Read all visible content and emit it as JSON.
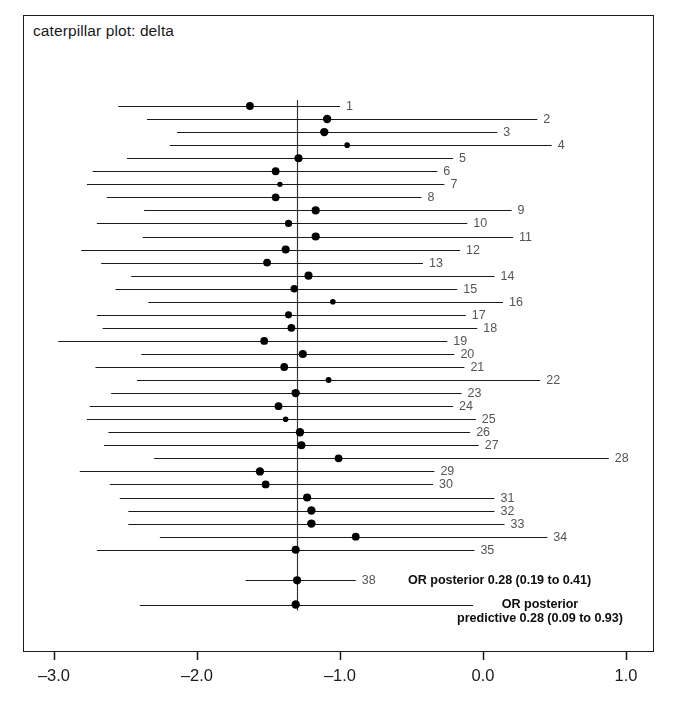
{
  "chart_data": {
    "type": "scatter",
    "title": "caterpillar plot: delta",
    "xlabel": "",
    "ylabel": "",
    "xlim": [
      -3.45,
      1.2
    ],
    "xticks": [
      -3.0,
      -2.0,
      -1.0,
      0.0,
      1.0
    ],
    "xticklabels": [
      "-3.0",
      "-2.0",
      "-1.0",
      "0.0",
      "1.0"
    ],
    "grid": false,
    "legend": null,
    "reference_line": -1.3,
    "points": [
      {
        "label": "1",
        "estimate": -1.63,
        "low": -2.55,
        "high": -1.0,
        "size": 5.0
      },
      {
        "label": "2",
        "estimate": -1.09,
        "low": -2.35,
        "high": 0.38,
        "size": 5.4
      },
      {
        "label": "3",
        "estimate": -1.11,
        "low": -2.14,
        "high": 0.1,
        "size": 5.4
      },
      {
        "label": "4",
        "estimate": -0.95,
        "low": -2.19,
        "high": 0.48,
        "size": 3.6
      },
      {
        "label": "5",
        "estimate": -1.29,
        "low": -2.49,
        "high": -0.21,
        "size": 5.2
      },
      {
        "label": "6",
        "estimate": -1.45,
        "low": -2.73,
        "high": -0.32,
        "size": 5.0
      },
      {
        "label": "7",
        "estimate": -1.42,
        "low": -2.77,
        "high": -0.27,
        "size": 3.4
      },
      {
        "label": "8",
        "estimate": -1.45,
        "low": -2.63,
        "high": -0.43,
        "size": 5.0
      },
      {
        "label": "9",
        "estimate": -1.17,
        "low": -2.37,
        "high": 0.2,
        "size": 5.2
      },
      {
        "label": "10",
        "estimate": -1.36,
        "low": -2.7,
        "high": -0.11,
        "size": 4.6
      },
      {
        "label": "11",
        "estimate": -1.17,
        "low": -2.38,
        "high": 0.21,
        "size": 5.2
      },
      {
        "label": "12",
        "estimate": -1.38,
        "low": -2.81,
        "high": -0.16,
        "size": 5.2
      },
      {
        "label": "13",
        "estimate": -1.51,
        "low": -2.67,
        "high": -0.42,
        "size": 5.0
      },
      {
        "label": "14",
        "estimate": -1.22,
        "low": -2.46,
        "high": 0.08,
        "size": 5.2
      },
      {
        "label": "15",
        "estimate": -1.32,
        "low": -2.57,
        "high": -0.18,
        "size": 4.8
      },
      {
        "label": "16",
        "estimate": -1.05,
        "low": -2.34,
        "high": 0.14,
        "size": 3.6
      },
      {
        "label": "17",
        "estimate": -1.36,
        "low": -2.7,
        "high": -0.12,
        "size": 4.6
      },
      {
        "label": "18",
        "estimate": -1.34,
        "low": -2.66,
        "high": -0.04,
        "size": 5.0
      },
      {
        "label": "19",
        "estimate": -1.53,
        "low": -2.97,
        "high": -0.25,
        "size": 5.0
      },
      {
        "label": "20",
        "estimate": -1.26,
        "low": -2.39,
        "high": -0.2,
        "size": 5.2
      },
      {
        "label": "21",
        "estimate": -1.39,
        "low": -2.71,
        "high": -0.13,
        "size": 5.0
      },
      {
        "label": "22",
        "estimate": -1.08,
        "low": -2.42,
        "high": 0.4,
        "size": 3.8
      },
      {
        "label": "23",
        "estimate": -1.31,
        "low": -2.6,
        "high": -0.15,
        "size": 5.4
      },
      {
        "label": "24",
        "estimate": -1.43,
        "low": -2.75,
        "high": -0.21,
        "size": 5.0
      },
      {
        "label": "25",
        "estimate": -1.38,
        "low": -2.77,
        "high": -0.05,
        "size": 3.6
      },
      {
        "label": "26",
        "estimate": -1.28,
        "low": -2.62,
        "high": -0.09,
        "size": 5.4
      },
      {
        "label": "27",
        "estimate": -1.27,
        "low": -2.65,
        "high": -0.03,
        "size": 5.2
      },
      {
        "label": "28",
        "estimate": -1.01,
        "low": -2.3,
        "high": 0.88,
        "size": 5.0
      },
      {
        "label": "29",
        "estimate": -1.56,
        "low": -2.82,
        "high": -0.34,
        "size": 5.4
      },
      {
        "label": "30",
        "estimate": -1.52,
        "low": -2.61,
        "high": -0.35,
        "size": 5.0
      },
      {
        "label": "31",
        "estimate": -1.23,
        "low": -2.54,
        "high": 0.08,
        "size": 5.2
      },
      {
        "label": "32",
        "estimate": -1.2,
        "low": -2.48,
        "high": 0.08,
        "size": 5.4
      },
      {
        "label": "33",
        "estimate": -1.2,
        "low": -2.48,
        "high": 0.15,
        "size": 5.4
      },
      {
        "label": "34",
        "estimate": -0.89,
        "low": -2.26,
        "high": 0.45,
        "size": 5.0
      },
      {
        "label": "35",
        "estimate": -1.31,
        "low": -2.7,
        "high": -0.06,
        "size": 5.2
      },
      {
        "label": "38",
        "estimate": -1.3,
        "low": -1.66,
        "high": -0.89,
        "size": 5.2
      },
      {
        "label": "",
        "estimate": -1.31,
        "low": -2.4,
        "high": -0.07,
        "size": 5.4
      }
    ],
    "annotations": [
      {
        "id": "posterior",
        "text": "OR posterior 0.28 (0.19 to 0.41)"
      },
      {
        "id": "predictive_line1",
        "text": "OR posterior"
      },
      {
        "id": "predictive_line2",
        "text": "predictive 0.28 (0.09 to 0.93)"
      }
    ]
  },
  "colors": {
    "frame": "#1a1a1a",
    "line": "#1a1a1a",
    "marker": "#000000",
    "reference": "#333333",
    "row_label": "#555555",
    "axis_text": "#1a1a1a",
    "background": "#ffffff"
  }
}
